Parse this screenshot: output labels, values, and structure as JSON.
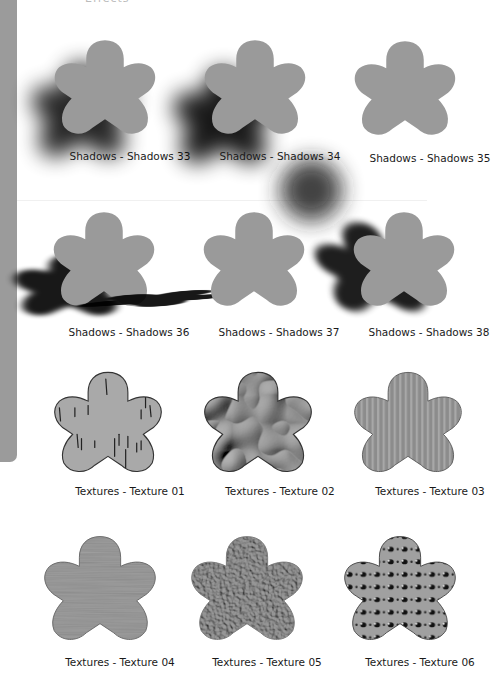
{
  "page": {
    "header_fragment": "Effects",
    "flower_color": "#9a9a9a",
    "sidebar_color": "#9b9b9b"
  },
  "rows": [
    {
      "items": [
        {
          "label": "Shadows - Shadows 33",
          "effect": "shadow-blur-left"
        },
        {
          "label": "Shadows - Shadows 34",
          "effect": "shadow-double-blob"
        },
        {
          "label": "Shadows - Shadows 35",
          "effect": "none"
        }
      ]
    },
    {
      "items": [
        {
          "label": "Shadows - Shadows 36",
          "effect": "shadow-cast-left"
        },
        {
          "label": "Shadows - Shadows 37",
          "effect": "shadow-ground-flat"
        },
        {
          "label": "Shadows - Shadows 38",
          "effect": "shadow-cast-diagonal"
        }
      ]
    },
    {
      "items": [
        {
          "label": "Textures - Texture 01",
          "effect": "texture-birch-streaks"
        },
        {
          "label": "Textures - Texture 02",
          "effect": "texture-liquid-chrome"
        },
        {
          "label": "Textures - Texture 03",
          "effect": "texture-vertical-stripes"
        }
      ]
    },
    {
      "items": [
        {
          "label": "Textures - Texture 04",
          "effect": "texture-horizontal-grain"
        },
        {
          "label": "Textures - Texture 05",
          "effect": "texture-stucco-bumps"
        },
        {
          "label": "Textures - Texture 06",
          "effect": "texture-dot-grid"
        }
      ]
    }
  ]
}
